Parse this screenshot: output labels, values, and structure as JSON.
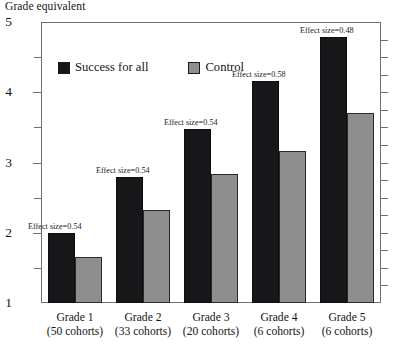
{
  "chart_data": {
    "type": "bar",
    "title": "Grade equivalent",
    "xlabel": "",
    "ylabel": "Grade equivalent",
    "ylim": [
      1,
      5
    ],
    "yticks": [
      1,
      2,
      3,
      4,
      5
    ],
    "ytick_labels": [
      "1",
      "2",
      "3",
      "4",
      "5"
    ],
    "minor_tick_step": 0.25,
    "grid": false,
    "legend_position": "upper-left-inside",
    "categories": [
      "Grade 1",
      "Grade 2",
      "Grade 3",
      "Grade 4",
      "Grade 5"
    ],
    "category_sublabels": [
      "(50 cohorts)",
      "(33 cohorts)",
      "(20 cohorts)",
      "(6 cohorts)",
      "(6 cohorts)"
    ],
    "series": [
      {
        "name": "Success for all",
        "color": "#17171a",
        "values": [
          2.0,
          2.8,
          3.48,
          4.16,
          4.78
        ]
      },
      {
        "name": "Control",
        "color": "#8e8e8e",
        "values": [
          1.65,
          2.32,
          2.84,
          3.16,
          3.7
        ]
      }
    ],
    "annotations": [
      "Effect size=0.54",
      "Effect size=0.54",
      "Effect size=0.54",
      "Effect size=0.58",
      "Effect size=0.48"
    ]
  },
  "axis": {
    "title": "Grade equivalent"
  },
  "legend": {
    "items": [
      {
        "label": "Success for all"
      },
      {
        "label": "Control"
      }
    ]
  }
}
